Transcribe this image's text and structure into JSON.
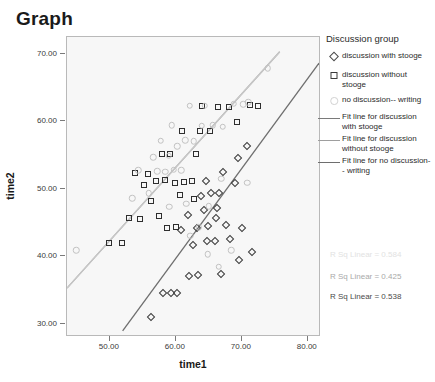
{
  "title": "Graph",
  "legend": {
    "title": "Discussion group",
    "marker_items": [
      {
        "label": "discussion with stooge",
        "icon": "diamond-marker-icon"
      },
      {
        "label": "discussion without stooge",
        "icon": "square-marker-icon"
      },
      {
        "label": "no discussion-- writing",
        "icon": "circle-marker-icon"
      }
    ],
    "line_items": [
      {
        "label": "Fit line for discussion with stooge",
        "color": "#7a7a7a"
      },
      {
        "label": "Fit line for discussion without stooge",
        "color": "#9e9e9e"
      },
      {
        "label": "Fit line for no discussion-- writing",
        "color": "#6e6e6e"
      }
    ]
  },
  "annotations": [
    {
      "text": "R Sq Linear = 0.584",
      "color": "#e2e2e2"
    },
    {
      "text": "R Sq Linear = 0.425",
      "color": "#a9a9a9"
    },
    {
      "text": "R Sq Linear = 0.538",
      "color": "#4a4a4a"
    }
  ],
  "chart_data": {
    "type": "scatter",
    "title": "Graph",
    "xlabel": "time1",
    "ylabel": "time2",
    "xlim": [
      43.5,
      82.0
    ],
    "ylim": [
      28.0,
      72.5
    ],
    "xticks": [
      "50.00",
      "60.00",
      "70.00",
      "80.00"
    ],
    "xtick_values": [
      50,
      60,
      70,
      80
    ],
    "yticks": [
      "30.00",
      "40.00",
      "50.00",
      "60.00",
      "70.00"
    ],
    "ytick_values": [
      30,
      40,
      50,
      60,
      70
    ],
    "grid": false,
    "legend_position": "right",
    "series": [
      {
        "name": "discussion with stooge",
        "marker": "diamond",
        "color": "#3b3b3b",
        "points": [
          [
            56.2,
            30.9
          ],
          [
            58.0,
            34.6
          ],
          [
            59.3,
            34.6
          ],
          [
            60.2,
            34.6
          ],
          [
            62.0,
            37.1
          ],
          [
            63.3,
            37.2
          ],
          [
            66.8,
            37.4
          ],
          [
            69.5,
            39.4
          ],
          [
            71.5,
            40.6
          ],
          [
            62.6,
            41.6
          ],
          [
            64.7,
            42.3
          ],
          [
            66.0,
            42.2
          ],
          [
            68.2,
            42.6
          ],
          [
            60.8,
            43.9
          ],
          [
            63.2,
            44.1
          ],
          [
            64.9,
            44.5
          ],
          [
            67.6,
            44.6
          ],
          [
            70.1,
            44.2
          ],
          [
            64.2,
            46.8
          ],
          [
            66.3,
            47.2
          ],
          [
            63.8,
            48.9
          ],
          [
            65.4,
            49.3
          ],
          [
            66.6,
            49.4
          ],
          [
            68.9,
            50.9
          ],
          [
            64.6,
            51.2
          ],
          [
            67.2,
            52.5
          ],
          [
            69.4,
            54.6
          ],
          [
            70.8,
            56.3
          ],
          [
            66.1,
            45.6
          ],
          [
            61.9,
            46.1
          ]
        ]
      },
      {
        "name": "discussion without stooge",
        "marker": "square",
        "color": "#2e2e2e",
        "points": [
          [
            49.8,
            41.9
          ],
          [
            51.8,
            41.9
          ],
          [
            54.6,
            45.5
          ],
          [
            56.2,
            48.2
          ],
          [
            57.5,
            46.0
          ],
          [
            55.1,
            50.6
          ],
          [
            57.0,
            51.1
          ],
          [
            58.3,
            51.3
          ],
          [
            55.8,
            52.2
          ],
          [
            53.8,
            52.4
          ],
          [
            57.9,
            55.1
          ],
          [
            59.8,
            50.9
          ],
          [
            61.3,
            51.0
          ],
          [
            62.4,
            51.1
          ],
          [
            60.6,
            49.0
          ],
          [
            62.8,
            48.5
          ],
          [
            59.1,
            55.2
          ],
          [
            61.0,
            58.5
          ],
          [
            63.6,
            58.6
          ],
          [
            65.2,
            58.5
          ],
          [
            64.0,
            62.3
          ],
          [
            66.4,
            62.1
          ],
          [
            68.0,
            62.1
          ],
          [
            71.3,
            62.4
          ],
          [
            72.4,
            62.3
          ],
          [
            58.6,
            44.2
          ],
          [
            60.0,
            44.3
          ],
          [
            52.9,
            45.6
          ],
          [
            63.1,
            55.2
          ],
          [
            69.2,
            59.9
          ]
        ]
      },
      {
        "name": "no discussion-- writing",
        "marker": "circle",
        "color": "#c2c2c2",
        "points": [
          [
            44.9,
            40.9
          ],
          [
            53.4,
            48.6
          ],
          [
            55.9,
            49.3
          ],
          [
            57.2,
            52.6
          ],
          [
            54.3,
            52.7
          ],
          [
            58.4,
            52.5
          ],
          [
            59.7,
            52.8
          ],
          [
            60.8,
            52.7
          ],
          [
            56.6,
            54.7
          ],
          [
            58.9,
            54.9
          ],
          [
            60.2,
            56.3
          ],
          [
            57.7,
            57.1
          ],
          [
            61.4,
            57.2
          ],
          [
            62.7,
            57.0
          ],
          [
            59.4,
            59.4
          ],
          [
            63.9,
            59.3
          ],
          [
            65.6,
            59.4
          ],
          [
            67.1,
            59.2
          ],
          [
            62.1,
            62.3
          ],
          [
            64.4,
            62.3
          ],
          [
            68.8,
            62.6
          ],
          [
            70.2,
            62.5
          ],
          [
            71.0,
            62.8
          ],
          [
            73.9,
            67.9
          ],
          [
            66.9,
            51.5
          ],
          [
            65.0,
            47.4
          ],
          [
            63.5,
            44.3
          ],
          [
            62.2,
            43.0
          ],
          [
            64.8,
            40.3
          ],
          [
            66.5,
            38.4
          ],
          [
            68.4,
            40.9
          ],
          [
            70.8,
            50.9
          ],
          [
            61.6,
            47.8
          ],
          [
            59.0,
            47.3
          ]
        ]
      }
    ],
    "fit_lines": [
      {
        "name": "Fit line for discussion with stooge",
        "color": "#6e6e6e",
        "r_squared": 0.538,
        "x1": 52.0,
        "y1": 28.6,
        "x2": 82.0,
        "y2": 68.6
      },
      {
        "name": "Fit line for discussion without stooge",
        "color": "#9e9e9e",
        "r_squared": 0.425,
        "x1": 43.5,
        "y1": 35.0,
        "x2": 76.0,
        "y2": 70.3
      },
      {
        "name": "Fit line for no discussion-- writing",
        "color": "#c9c9c9",
        "r_squared": 0.584,
        "x1": 43.5,
        "y1": 35.0,
        "x2": 76.0,
        "y2": 70.3
      }
    ]
  }
}
